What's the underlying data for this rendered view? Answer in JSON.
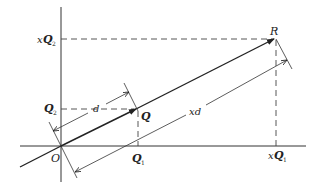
{
  "diagram": {
    "type": "vector-scaling-diagram",
    "origin": {
      "label": "O"
    },
    "points": [
      {
        "id": "Q",
        "label": "Q"
      },
      {
        "id": "R",
        "label": "R"
      }
    ],
    "axis_labels": {
      "q1": {
        "main": "Q",
        "sub": "1"
      },
      "q2": {
        "main": "Q",
        "sub": "2"
      },
      "xq1": {
        "prefix": "x",
        "main": "Q",
        "sub": "1"
      },
      "xq2": {
        "prefix": "x",
        "main": "Q",
        "sub": "2"
      }
    },
    "dimensions": [
      {
        "id": "d",
        "label": "d"
      },
      {
        "id": "xd",
        "label": "xd"
      }
    ],
    "colors": {
      "stroke": "#222222",
      "dashed": "#444444",
      "background": "#ffffff"
    }
  }
}
